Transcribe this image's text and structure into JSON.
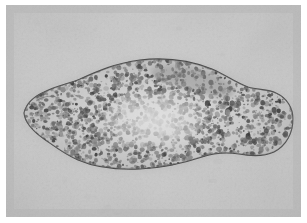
{
  "figure": {
    "kind": "photomicrograph",
    "subject_label": "flatworm-specimen",
    "modality": "brightfield-light-microscopy",
    "orientation": "horizontal",
    "visible_text": "",
    "scale_bar": "",
    "annotations": []
  },
  "canvas": {
    "width": 307,
    "height": 223,
    "border_color": "#ffffff",
    "border_left": 6,
    "border_top": 5,
    "plate_width": 295,
    "plate_height": 212
  },
  "palette": {
    "background_light": "#cfcfcf",
    "background_mid": "#c5c5c5",
    "background_dark": "#bcbcbc",
    "body_fill": "#b9b9b9",
    "body_light": "#d6d6d6",
    "body_core_light": "#d9d9d9",
    "granule_dark": "#3a3a3a",
    "granule_mid": "#6e6e6e",
    "outline": "#4a4a4a",
    "vignette": "#b3b3b3"
  },
  "specimen": {
    "name": "fluke-body",
    "anterior_end": "tapered-point-left",
    "posterior_end": "rounded-lobe-right",
    "outline_stroke_width": 1.1,
    "body_path": "M 18 108 C 20 99, 27 92, 38 87 C 50 81, 62 79, 74 74 C 92 66, 110 58, 134 55 C 160 52, 186 56, 206 64 C 220 70, 230 78, 242 82 C 252 85, 262 84, 270 88 C 281 93, 287 103, 287 114 C 287 128, 280 141, 268 147 C 257 152, 244 151, 233 149 C 220 147, 208 148, 196 152 C 178 158, 158 163, 134 164 C 110 165, 88 162, 72 155 C 58 149, 48 141, 38 134 C 28 127, 19 119, 18 108 Z",
    "inner_light_path": "M 120 92 C 145 84, 172 86, 190 96 C 202 103, 203 118, 193 128 C 178 142, 150 146, 126 141 C 108 137, 99 125, 103 112 C 106 102, 112 95, 120 92 Z",
    "dark_band_path": "M 150 62 C 178 58, 206 66, 224 78 C 232 84, 228 94, 218 93 C 198 91, 176 82, 154 76 C 144 73, 141 64, 150 62 Z",
    "notch_path": "M 30 96 C 36 92, 44 90, 50 92"
  },
  "texture": {
    "granule_count": 2300,
    "granule_min_radius": 0.6,
    "granule_max_radius": 2.6,
    "seed": 20240517
  }
}
